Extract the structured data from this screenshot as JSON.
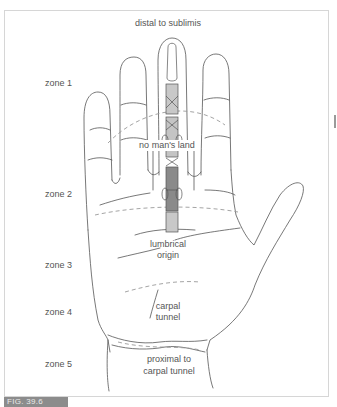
{
  "figure": {
    "label": "FIG. 39.6",
    "type": "flexor tendon zones of the hand"
  },
  "labels": {
    "top": "distal to sublimis",
    "no_mans_land": "no man's land",
    "lumbrical_line1": "lumbrical",
    "lumbrical_line2": "origin",
    "carpal_line1": "carpal",
    "carpal_line2": "tunnel",
    "proximal_line1": "proximal to",
    "proximal_line2": "carpal tunnel"
  },
  "zones": [
    {
      "id": "zone-1",
      "label": "zone 1"
    },
    {
      "id": "zone-2",
      "label": "zone 2"
    },
    {
      "id": "zone-3",
      "label": "zone 3"
    },
    {
      "id": "zone-4",
      "label": "zone 4"
    },
    {
      "id": "zone-5",
      "label": "zone 5"
    }
  ],
  "colors": {
    "outline": "#555555",
    "dashed": "#9a9a9a",
    "tendon_dark": "#8a8a8a",
    "tendon_light": "#c4c4c4",
    "fig_tab": "#8c8c8c"
  }
}
